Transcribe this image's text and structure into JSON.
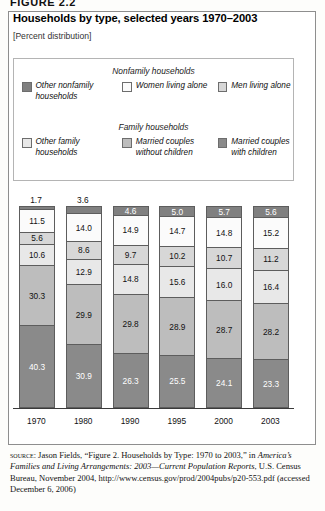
{
  "figure_label": "FIGURE 2.2",
  "chart_title": "Households by type, selected years 1970–2003",
  "chart_subtitle": "[Percent distribution]",
  "legend": {
    "groups": [
      {
        "title": "Nonfamily households",
        "items": [
          {
            "label": "Other nonfamily households",
            "color": "#808080"
          },
          {
            "label": "Women living alone",
            "color": "#fbfbfb"
          },
          {
            "label": "Men living alone",
            "color": "#d7d7d7"
          }
        ]
      },
      {
        "title": "Family households",
        "items": [
          {
            "label": "Other family households",
            "color": "#e8e8e8"
          },
          {
            "label": "Married couples without children",
            "color": "#bdbdbd"
          },
          {
            "label": "Married couples with children",
            "color": "#8a8a8a"
          }
        ]
      }
    ]
  },
  "source": {
    "keyword": "source:",
    "line1": " Jason Fields, “Figure 2. Households by Type: 1970 to 2003,” in",
    "line2_italic": "America’s Families and Living Arrangements: 2003—Current",
    "line3_italic": "Population Reports",
    "line3_rest": ", U.S. Census Bureau, November 2004, http://www",
    "line4": ".census.gov/prod/2004pubs/p20-553.pdf (accessed December 6, 2006)"
  },
  "chart_data": {
    "type": "bar",
    "subtype": "stacked-bar-100pct",
    "title": "Households by type, selected years 1970–2003",
    "subtitle": "[Percent distribution]",
    "xlabel": "",
    "ylabel": "Percent distribution",
    "ylim": [
      0,
      100
    ],
    "grid": false,
    "legend_position": "top",
    "categories": [
      "1970",
      "1980",
      "1990",
      "1995",
      "2000",
      "2003"
    ],
    "series": [
      {
        "name": "Other nonfamily households",
        "color": "#808080",
        "text_color": "#ffffff",
        "values": [
          1.7,
          3.6,
          4.6,
          5.0,
          5.7,
          5.6
        ],
        "label_outside": [
          true,
          true,
          false,
          false,
          false,
          false
        ]
      },
      {
        "name": "Women living alone",
        "color": "#fbfbfb",
        "text_color": "#111111",
        "values": [
          11.5,
          14.0,
          14.9,
          14.7,
          14.8,
          15.2
        ],
        "label_outside": [
          false,
          false,
          false,
          false,
          false,
          false
        ]
      },
      {
        "name": "Men living alone",
        "color": "#d7d7d7",
        "text_color": "#111111",
        "values": [
          5.6,
          8.6,
          9.7,
          10.2,
          10.7,
          11.2
        ],
        "label_outside": [
          false,
          false,
          false,
          false,
          false,
          false
        ]
      },
      {
        "name": "Other family households",
        "color": "#e8e8e8",
        "text_color": "#111111",
        "values": [
          10.6,
          12.9,
          14.8,
          15.6,
          16.0,
          16.4
        ],
        "label_outside": [
          false,
          false,
          false,
          false,
          false,
          false
        ]
      },
      {
        "name": "Married couples without children",
        "color": "#bdbdbd",
        "text_color": "#111111",
        "values": [
          30.3,
          29.9,
          29.8,
          28.9,
          28.7,
          28.2
        ],
        "label_outside": [
          false,
          false,
          false,
          false,
          false,
          false
        ]
      },
      {
        "name": "Married couples with children",
        "color": "#8a8a8a",
        "text_color": "#ffffff",
        "values": [
          40.3,
          30.9,
          26.3,
          25.5,
          24.1,
          23.3
        ],
        "label_outside": [
          false,
          false,
          false,
          false,
          false,
          false
        ]
      }
    ]
  }
}
